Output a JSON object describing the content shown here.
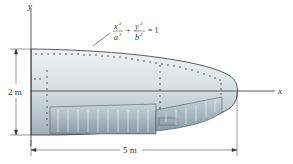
{
  "figure": {
    "axis_labels": {
      "x": "x",
      "y": "y"
    },
    "equation": {
      "term1_num": "x",
      "term1_den": "a",
      "term2_num": "y",
      "term2_den": "b",
      "exp": "2",
      "plus": "+",
      "rhs": "= 1"
    },
    "dimensions": {
      "height": "2 m",
      "length": "5 m"
    },
    "colors": {
      "body_light": "#e4eaee",
      "body_mid": "#c3ced6",
      "body_dark": "#8e9ea9",
      "outline": "#333333",
      "panel": "#a9b8c2"
    }
  }
}
